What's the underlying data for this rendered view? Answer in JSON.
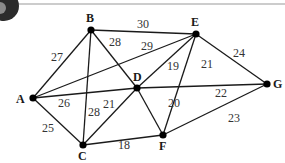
{
  "diagram": {
    "type": "weighted-undirected-graph",
    "top_rule": true,
    "badge_icon": "dark-circular-badge",
    "nodes": [
      {
        "id": "A",
        "label": "A",
        "x": 33,
        "y": 98,
        "lx": 16,
        "ly": 103
      },
      {
        "id": "B",
        "label": "B",
        "x": 91,
        "y": 30,
        "lx": 86,
        "ly": 22
      },
      {
        "id": "C",
        "label": "C",
        "x": 83,
        "y": 145,
        "lx": 78,
        "ly": 160
      },
      {
        "id": "D",
        "label": "D",
        "x": 137,
        "y": 88,
        "lx": 133,
        "ly": 81
      },
      {
        "id": "E",
        "label": "E",
        "x": 196,
        "y": 34,
        "lx": 191,
        "ly": 26
      },
      {
        "id": "F",
        "label": "F",
        "x": 163,
        "y": 135,
        "lx": 159,
        "ly": 150
      },
      {
        "id": "G",
        "label": "G",
        "x": 267,
        "y": 84,
        "lx": 273,
        "ly": 88
      }
    ],
    "edges": [
      {
        "from": "A",
        "to": "B",
        "weight": "27",
        "lx": 51,
        "ly": 61
      },
      {
        "from": "A",
        "to": "C",
        "weight": "25",
        "lx": 42,
        "ly": 132
      },
      {
        "from": "A",
        "to": "D",
        "weight": "26",
        "lx": 58,
        "ly": 107
      },
      {
        "from": "A",
        "to": "E",
        "weight": "29",
        "lx": 141,
        "ly": 50
      },
      {
        "from": "B",
        "to": "E",
        "weight": "30",
        "lx": 137,
        "ly": 28
      },
      {
        "from": "B",
        "to": "C",
        "weight": "28",
        "lx": 88,
        "ly": 116
      },
      {
        "from": "B",
        "to": "D",
        "weight": "28",
        "lx": 109,
        "ly": 46
      },
      {
        "from": "C",
        "to": "D",
        "weight": "21",
        "lx": 103,
        "ly": 108
      },
      {
        "from": "C",
        "to": "F",
        "weight": "18",
        "lx": 118,
        "ly": 149
      },
      {
        "from": "D",
        "to": "E",
        "weight": "19",
        "lx": 167,
        "ly": 70
      },
      {
        "from": "D",
        "to": "F",
        "weight": "20",
        "lx": 168,
        "ly": 107
      },
      {
        "from": "E",
        "to": "F",
        "weight": "21",
        "lx": 201,
        "ly": 68
      },
      {
        "from": "D",
        "to": "G",
        "weight": "22",
        "lx": 215,
        "ly": 97
      },
      {
        "from": "E",
        "to": "G",
        "weight": "24",
        "lx": 233,
        "ly": 57
      },
      {
        "from": "F",
        "to": "G",
        "weight": "23",
        "lx": 228,
        "ly": 122
      }
    ]
  }
}
